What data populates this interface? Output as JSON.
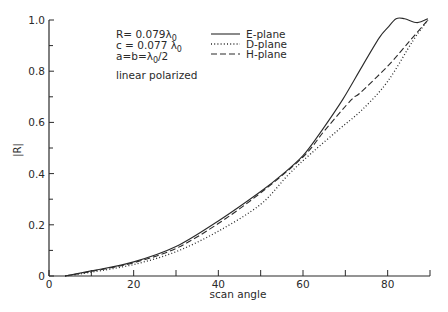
{
  "chart_data": {
    "type": "line",
    "title": "",
    "xlabel": "scan angle",
    "ylabel": "|R|",
    "xlim": [
      0,
      90
    ],
    "ylim": [
      0,
      1.0
    ],
    "x_ticks_major": [
      0,
      20,
      40,
      60,
      80
    ],
    "x_ticks_minor": [
      10,
      30,
      50,
      70,
      90
    ],
    "x_tick_labels": [
      "0",
      "20",
      "40",
      "60",
      "80"
    ],
    "y_ticks_major": [
      0,
      0.2,
      0.4,
      0.6,
      0.8,
      1.0
    ],
    "y_ticks_minor": [
      0.1,
      0.3,
      0.5,
      0.7,
      0.9
    ],
    "y_tick_labels": [
      "0",
      "0.2",
      "0.4",
      "0.6",
      "0.8",
      "1.0"
    ],
    "grid": false,
    "legend_position": "upper center",
    "annotations": [
      {
        "text": "R= 0.079λ",
        "sub": "0"
      },
      {
        "text": "c = 0.077 λ",
        "sub": "0"
      },
      {
        "text": "a=b=λ",
        "sub": "0",
        "suffix": "/2"
      },
      {
        "text": "linear polarized"
      }
    ],
    "series": [
      {
        "name": "E-plane",
        "style": "solid",
        "x": [
          3.8,
          10,
          20,
          30,
          40,
          50,
          55,
          60,
          64.5,
          69.4,
          74,
          78,
          80,
          82,
          84,
          87,
          89.5
        ],
        "y": [
          0,
          0.02,
          0.055,
          0.115,
          0.215,
          0.33,
          0.395,
          0.47,
          0.57,
          0.69,
          0.82,
          0.93,
          0.97,
          1.005,
          1.005,
          0.99,
          1.005
        ]
      },
      {
        "name": "D-plane",
        "style": "dotted",
        "x": [
          3.8,
          10,
          20,
          30,
          40,
          50,
          56.5,
          62,
          68.3,
          74,
          80,
          86,
          89.5
        ],
        "y": [
          0,
          0.015,
          0.045,
          0.095,
          0.175,
          0.28,
          0.395,
          0.48,
          0.57,
          0.65,
          0.76,
          0.92,
          1.0
        ]
      },
      {
        "name": "H-plane",
        "style": "dashed",
        "x": [
          3.8,
          10,
          20,
          30,
          40,
          50,
          60,
          65.2,
          71.5,
          73.5,
          80,
          85.3,
          89.5
        ],
        "y": [
          0,
          0.018,
          0.052,
          0.108,
          0.205,
          0.325,
          0.465,
          0.57,
          0.69,
          0.715,
          0.82,
          0.92,
          1.0
        ]
      }
    ]
  }
}
